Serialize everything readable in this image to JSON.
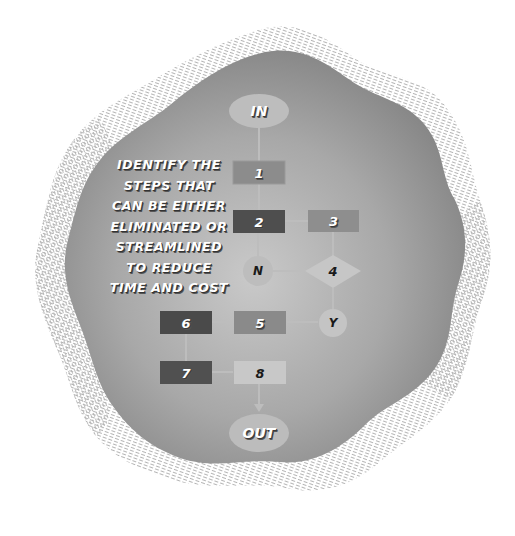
{
  "caption": {
    "lines": [
      "IDENTIFY THE",
      "STEPS THAT",
      "CAN BE EITHER",
      "ELIMINATED OR",
      "STREAMLINED",
      "TO REDUCE",
      "TIME AND COST"
    ]
  },
  "nodes": {
    "in": {
      "label": "IN",
      "shape": "ellipse"
    },
    "s1": {
      "label": "1",
      "shape": "rect",
      "fill": "#8c8c8c"
    },
    "s2": {
      "label": "2",
      "shape": "rect",
      "fill": "#4e4e4e"
    },
    "s3": {
      "label": "3",
      "shape": "rect",
      "fill": "#8e8e8e"
    },
    "s4": {
      "label": "4",
      "shape": "diamond",
      "fill": "#c6c6c6"
    },
    "n": {
      "label": "N",
      "shape": "circle",
      "fill": "#bdbdbd"
    },
    "y": {
      "label": "Y",
      "shape": "circle",
      "fill": "#c4c4c4"
    },
    "s5": {
      "label": "5",
      "shape": "rect",
      "fill": "#8a8a8a"
    },
    "s6": {
      "label": "6",
      "shape": "rect",
      "fill": "#4a4a4a"
    },
    "s7": {
      "label": "7",
      "shape": "rect",
      "fill": "#505050"
    },
    "s8": {
      "label": "8",
      "shape": "rect",
      "fill": "#c8c8c8"
    },
    "out": {
      "label": "OUT",
      "shape": "ellipse"
    }
  },
  "colors": {
    "blob_center": "#c4c4c4",
    "blob_edge": "#8a8a8a",
    "hatch": "#bdbdbd",
    "connector": "#bcbcbc",
    "ellipse_fill": "#bcbcbc"
  }
}
